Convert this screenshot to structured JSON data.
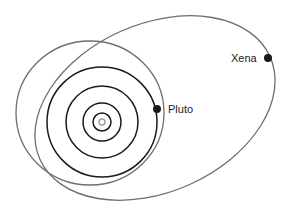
{
  "diagram": {
    "title": "",
    "colors": {
      "background": "#ffffff",
      "planet_orbit": "#1a1a1a",
      "dwarf_orbit": "#6e6e6e",
      "sun": "#9a9a9a",
      "body_dot": "#1a1a1a",
      "label": "#222222"
    },
    "sun": {
      "cx": 102,
      "cy": 122,
      "r": 3
    },
    "planet_orbits": [
      {
        "r": 9
      },
      {
        "r": 19
      },
      {
        "r": 36
      },
      {
        "r": 55
      }
    ],
    "pluto": {
      "label": "Pluto",
      "orbit": {
        "cx": 90,
        "cy": 113,
        "rx": 74,
        "ry": 72,
        "rotate": 0
      },
      "dot": {
        "cx": 157,
        "cy": 109,
        "r": 4
      },
      "label_pos": {
        "x": 168,
        "y": 113
      }
    },
    "xena": {
      "label": "Xena",
      "orbit": {
        "cx": 155,
        "cy": 108,
        "rx": 126,
        "ry": 84,
        "rotate": -24
      },
      "dot": {
        "cx": 268,
        "cy": 58,
        "r": 4
      },
      "label_pos": {
        "x": 231,
        "y": 62
      }
    }
  }
}
